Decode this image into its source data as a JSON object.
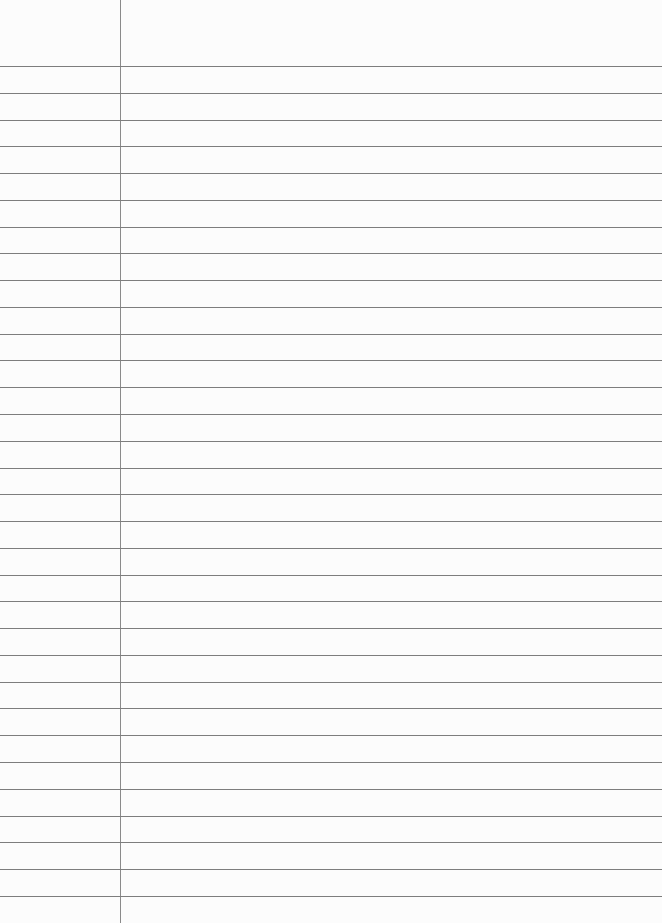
{
  "paper": {
    "type": "lined-paper",
    "background_color": "#fcfcfc",
    "line_color": "#7d7d7d",
    "margin_color": "#8a8a8a",
    "margin_x": 120,
    "first_line_y": 66,
    "line_spacing": 26.77,
    "line_count": 32
  }
}
